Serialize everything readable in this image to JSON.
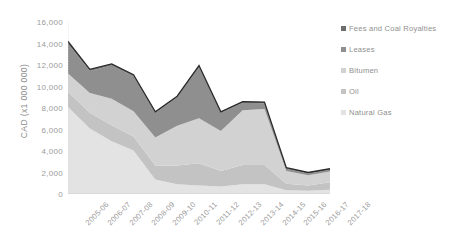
{
  "chart_data": {
    "type": "area",
    "title": "",
    "xlabel": "",
    "ylabel": "CAD (x1 000 000)",
    "ylim": [
      0,
      16000
    ],
    "ytick_step": 2000,
    "grid": false,
    "stacked": true,
    "legend_position": "right",
    "categories": [
      "2005-06",
      "2006-07",
      "2007-08",
      "2008-09",
      "2009-10",
      "2010-11",
      "2011-12",
      "2012-13",
      "2013-14",
      "2014-15",
      "2015-16",
      "2016-17",
      "2017-18"
    ],
    "yticks": [
      "0",
      "2,000",
      "4,000",
      "6,000",
      "8,000",
      "10,000",
      "12,000",
      "14,000",
      "16,000"
    ],
    "series": [
      {
        "name": "Natural Gas",
        "color": "#e3e3e3",
        "values": [
          8100,
          6100,
          4900,
          4050,
          1350,
          900,
          800,
          700,
          900,
          900,
          350,
          300,
          400
        ]
      },
      {
        "name": "Oil",
        "color": "#c3c3c3",
        "values": [
          1400,
          1450,
          1500,
          1300,
          1300,
          1750,
          2050,
          1450,
          1800,
          1800,
          600,
          500,
          700
        ]
      },
      {
        "name": "Bitumen",
        "color": "#d2d2d2",
        "values": [
          1700,
          1850,
          2450,
          2350,
          2600,
          3700,
          4200,
          3700,
          5100,
          5200,
          1200,
          950,
          1000
        ]
      },
      {
        "name": "Leases",
        "color": "#8f8f8f",
        "values": [
          2750,
          2050,
          3100,
          3250,
          2300,
          2650,
          4800,
          1700,
          700,
          550,
          200,
          150,
          150
        ]
      },
      {
        "name": "Fees and Coal Royalties",
        "color": "#6e6e6e",
        "values": [
          250,
          150,
          150,
          150,
          100,
          100,
          100,
          100,
          100,
          100,
          100,
          100,
          100
        ]
      }
    ]
  },
  "legend": {
    "items": [
      {
        "label": "Fees and Coal Royalties",
        "color": "#6e6e6e"
      },
      {
        "label": "Leases",
        "color": "#8f8f8f"
      },
      {
        "label": "Bitumen",
        "color": "#d2d2d2"
      },
      {
        "label": "Oil",
        "color": "#c3c3c3"
      },
      {
        "label": "Natural Gas",
        "color": "#e3e3e3"
      }
    ]
  }
}
